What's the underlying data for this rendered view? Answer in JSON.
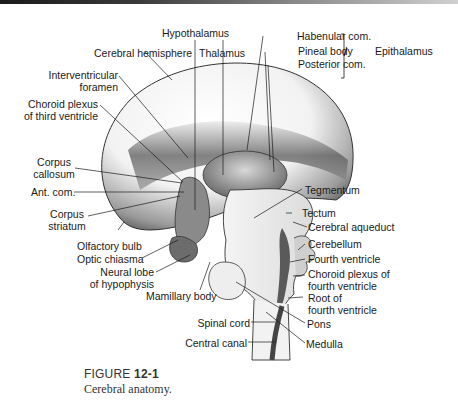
{
  "figure": {
    "number_prefix": "FIGURE",
    "number": "12-1",
    "caption": "Cerebral anatomy."
  },
  "labels": {
    "hypothalamus": "Hypothalamus",
    "cerebral_hemisphere": "Cerebral hemisphere",
    "thalamus": "Thalamus",
    "interventricular_1": "Interventricular",
    "interventricular_2": "foramen",
    "choroid_third_1": "Choroid plexus",
    "choroid_third_2": "of third ventricle",
    "corpus_callosum_1": "Corpus",
    "corpus_callosum_2": "callosum",
    "ant_com": "Ant. com.",
    "corpus_striatum_1": "Corpus",
    "corpus_striatum_2": "striatum",
    "olfactory_bulb": "Olfactory bulb",
    "optic_chiasma": "Optic chiasma",
    "neural_lobe_1": "Neural lobe",
    "neural_lobe_2": "of hypophysis",
    "mamillary_body": "Mamillary body",
    "spinal_cord": "Spinal cord",
    "central_canal": "Central canal",
    "habenular_com": "Habenular com.",
    "pineal_body": "Pineal body",
    "posterior_com": "Posterior com.",
    "epithalamus": "Epithalamus",
    "tegmentum": "Tegmentum",
    "tectum": "Tectum",
    "cerebral_aqueduct": "Cerebral aqueduct",
    "cerebellum": "Cerebellum",
    "fourth_ventricle": "Fourth ventricle",
    "choroid_fourth_1": "Choroid plexus of",
    "choroid_fourth_2": "fourth ventricle",
    "root_fourth_1": "Root of",
    "root_fourth_2": "fourth ventricle",
    "pons": "Pons",
    "medulla": "Medulla"
  }
}
